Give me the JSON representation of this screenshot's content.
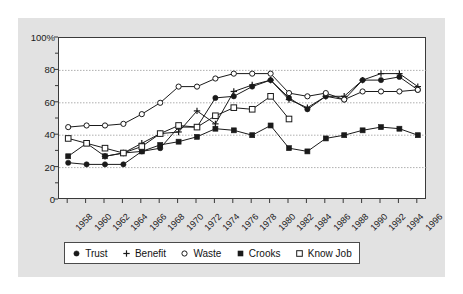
{
  "chart_data": {
    "type": "line",
    "title": "",
    "subtitle": "",
    "xlabel": "",
    "ylabel": "",
    "grid": true,
    "legend_position": "bottom",
    "xlim": [
      1958,
      1996
    ],
    "ylim": [
      0,
      100
    ],
    "ytick_labels": [
      "100%",
      "80",
      "60",
      "40",
      "20",
      "0"
    ],
    "ytick_values": [
      100,
      80,
      60,
      40,
      20,
      0
    ],
    "yminor_values": [
      90,
      70,
      50,
      30,
      10
    ],
    "gridline_values": [
      80,
      60,
      40,
      20
    ],
    "categories": [
      1958,
      1960,
      1962,
      1964,
      1966,
      1968,
      1970,
      1972,
      1974,
      1976,
      1978,
      1980,
      1982,
      1984,
      1986,
      1988,
      1990,
      1992,
      1994,
      1996
    ],
    "xtick_labels": [
      "1958",
      "1960",
      "1962",
      "1964",
      "1966",
      "1968",
      "1970",
      "1972",
      "1974",
      "1976",
      "1978",
      "1980",
      "1982",
      "1984",
      "1986",
      "1988",
      "1990",
      "1992",
      "1994",
      "1996"
    ],
    "series": [
      {
        "name": "Trust",
        "marker": "filled-circle",
        "values": [
          23,
          22,
          22,
          22,
          30,
          32,
          45,
          45,
          63,
          64,
          70,
          74,
          63,
          56,
          64,
          62,
          74,
          74,
          76,
          68
        ]
      },
      {
        "name": "Benefit",
        "marker": "plus",
        "values": [
          null,
          null,
          27,
          29,
          35,
          41,
          42,
          55,
          47,
          67,
          71,
          74,
          62,
          57,
          64,
          64,
          74,
          78,
          78,
          70
        ]
      },
      {
        "name": "Waste",
        "marker": "open-circle",
        "values": [
          45,
          46,
          46,
          47,
          53,
          60,
          70,
          70,
          75,
          78,
          78,
          78,
          66,
          64,
          66,
          62,
          67,
          67,
          67,
          68
        ]
      },
      {
        "name": "Crooks",
        "marker": "filled-square",
        "values": [
          27,
          35,
          27,
          29,
          30,
          34,
          36,
          39,
          44,
          43,
          40,
          46,
          32,
          30,
          38,
          40,
          43,
          45,
          44,
          40
        ]
      },
      {
        "name": "Know Job",
        "marker": "open-square",
        "values": [
          38,
          35,
          32,
          29,
          33,
          41,
          46,
          45,
          52,
          57,
          56,
          64,
          50,
          null,
          null,
          null,
          null,
          null,
          null,
          null
        ]
      }
    ]
  },
  "legend": {
    "entries": [
      {
        "label": "Trust",
        "marker": "filled-circle"
      },
      {
        "label": "Benefit",
        "marker": "plus"
      },
      {
        "label": "Waste",
        "marker": "open-circle"
      },
      {
        "label": "Crooks",
        "marker": "filled-square"
      },
      {
        "label": "Know Job",
        "marker": "open-square"
      }
    ]
  },
  "style": {
    "figure_background": "#e2e2e2",
    "plot_background": "#ffffff",
    "line_color": "#1a1a1a",
    "grid_color": "#9a9a9a",
    "axis_color": "#3a3a3a"
  }
}
